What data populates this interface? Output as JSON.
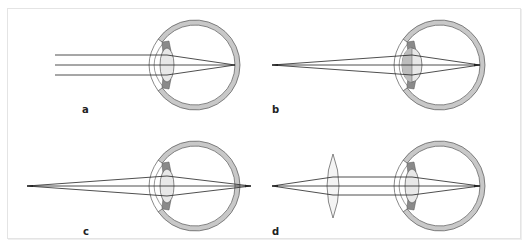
{
  "figure": {
    "panels": [
      {
        "label": "a",
        "rays": "parallel",
        "focus": "on-retina",
        "lens": "relaxed",
        "corrective_lens": false
      },
      {
        "label": "b",
        "rays": "diverging",
        "focus": "on-retina",
        "lens": "accommodated",
        "corrective_lens": false
      },
      {
        "label": "c",
        "rays": "diverging",
        "focus": "behind-retina",
        "lens": "relaxed",
        "corrective_lens": false
      },
      {
        "label": "d",
        "rays": "diverging",
        "focus": "on-retina",
        "lens": "relaxed",
        "corrective_lens": true
      }
    ]
  },
  "colors": {
    "sclera": "#c8c8c8",
    "outline": "#555555",
    "ray": "#222222",
    "lens_fill": "#e8e8e8",
    "lens_accommodated": "#bdbdbd",
    "ciliary": "#8a8a8a",
    "frame": "#e4e4e4"
  }
}
